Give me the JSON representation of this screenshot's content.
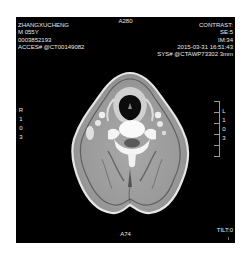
{
  "overlay": {
    "top_left": {
      "patient_name": "ZHANGXUCHENG",
      "sex_age": "M 055Y",
      "patient_id": "0003852193",
      "accession": "ACCES# @CT00149082"
    },
    "top_center": {
      "position": "A280"
    },
    "top_right": {
      "contrast": "CONTRAST:",
      "series": "SE:5",
      "image": "IM:34",
      "datetime": "2015-03-31 16:51:43",
      "system": "SYS# @CTAWP73302 3mm"
    },
    "left_orientation": [
      "R",
      "1",
      "0",
      "3"
    ],
    "right_orientation": [
      "L",
      "1",
      "0",
      "3"
    ],
    "bottom_center": {
      "position": "A74"
    },
    "bottom_right": {
      "tilt": "TILT:0"
    }
  },
  "image": {
    "modality": "CT",
    "description": "Axial CT slice of the neck showing airway, cervical vertebra, and surrounding soft tissue",
    "background": "#000000",
    "frame_color": "#ffffff"
  }
}
